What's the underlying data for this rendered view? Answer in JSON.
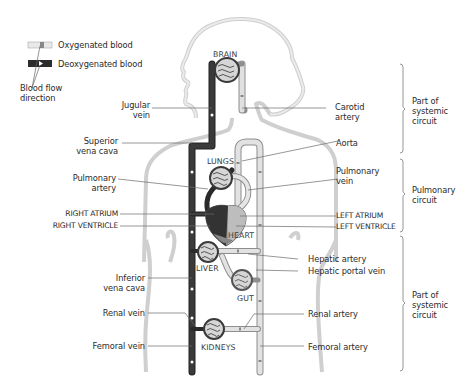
{
  "legend": {
    "oxygenated": "Oxygenated blood",
    "deoxygenated": "Deoxygenated blood",
    "flow": [
      "Blood flow",
      "direction"
    ]
  },
  "organs": {
    "brain": "BRAIN",
    "lungs": "LUNGS",
    "heart": "HEART",
    "liver": "LIVER",
    "gut": "GUT",
    "kidneys": "KIDNEYS"
  },
  "left_labels": {
    "jugular": [
      "Jugular",
      "vein"
    ],
    "superior_vc": [
      "Superior",
      "vena cava"
    ],
    "pulm_artery": [
      "Pulmonary",
      "artery"
    ],
    "right_atrium": "RIGHT ATRIUM",
    "right_ventricle": "RIGHT VENTRICLE",
    "inferior_vc": [
      "Inferior",
      "vena cava"
    ],
    "renal_vein": "Renal vein",
    "femoral_vein": "Femoral vein"
  },
  "right_labels": {
    "carotid": [
      "Carotid",
      "artery"
    ],
    "aorta": "Aorta",
    "pulm_vein": [
      "Pulmonary",
      "vein"
    ],
    "left_atrium": "LEFT ATRIUM",
    "left_ventricle": "LEFT VENTRICLE",
    "hepatic_artery": "Hepatic artery",
    "hepatic_portal": "Hepatic portal vein",
    "renal_artery": "Renal artery",
    "femoral_artery": "Femoral artery"
  },
  "circuits": [
    {
      "lines": [
        "Part of",
        "systemic",
        "circuit"
      ]
    },
    {
      "lines": [
        "Pulmonary",
        "circuit"
      ]
    },
    {
      "lines": [
        "Part of",
        "systemic",
        "circuit"
      ]
    }
  ],
  "colors": {
    "deoxygenated": "#2e2e2e",
    "oxygenated": "#dcdcdc",
    "vessel_edge": "#9a9a9a",
    "body_outline": "#c8c8c8",
    "heart_right": "#3a3a3a",
    "heart_left": "#a8a8a8"
  }
}
